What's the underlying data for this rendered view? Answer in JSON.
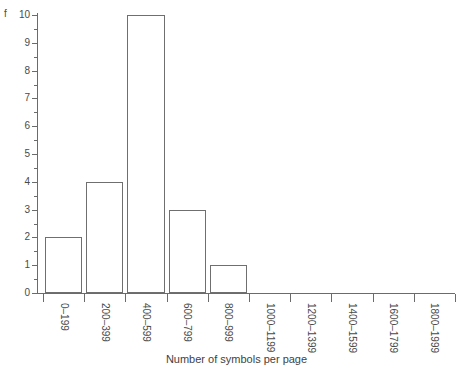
{
  "chart_data": {
    "type": "bar",
    "title": "",
    "subtitle": "",
    "xlabel": "Number of symbols per page",
    "ylabel": "f",
    "categories": [
      "0–199",
      "200–399",
      "400–599",
      "600–799",
      "800–999",
      "1000–1199",
      "1200–1399",
      "1400–1599",
      "1600–1799",
      "1800–1999"
    ],
    "values": [
      2,
      4,
      10,
      3,
      1,
      0,
      0,
      0,
      0,
      0
    ],
    "ylim": [
      0,
      10
    ],
    "ytick_labels": [
      "0",
      "1",
      "2",
      "3",
      "4",
      "5",
      "6",
      "7",
      "8",
      "9",
      "10"
    ],
    "ytick_values": [
      0,
      1,
      2,
      3,
      4,
      5,
      6,
      7,
      8,
      9,
      10
    ],
    "minor_tick_step": 0.5,
    "grid": false,
    "legend": false,
    "legend_position": "none",
    "bar_fill": "#ffffff",
    "bar_edge": "#6f6f6f",
    "axis_color": "#6b6b6b",
    "background": "#ffffff"
  }
}
